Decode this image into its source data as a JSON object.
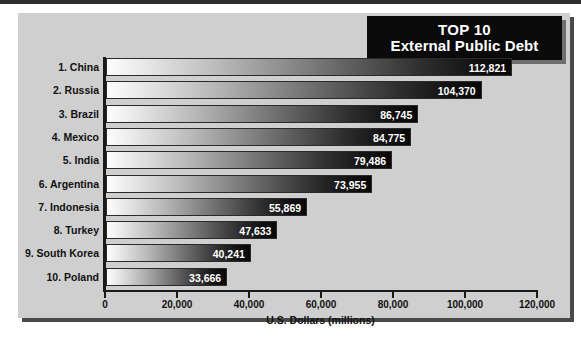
{
  "title": {
    "line1": "TOP 10",
    "line2": "External Public Debt"
  },
  "chart_data": {
    "type": "bar",
    "orientation": "horizontal",
    "title": "TOP 10 External Public Debt",
    "xlabel": "U.S. Dollars (millions)",
    "ylabel": "",
    "xlim": [
      0,
      120000
    ],
    "grid": false,
    "legend": false,
    "xticks": [
      0,
      20000,
      40000,
      60000,
      80000,
      100000,
      120000
    ],
    "xtick_labels": [
      "0",
      "20,000",
      "40,000",
      "60,000",
      "80,000",
      "100,000",
      "120,000"
    ],
    "categories": [
      "1. China",
      "2. Russia",
      "3. Brazil",
      "4. Mexico",
      "5. India",
      "6. Argentina",
      "7. Indonesia",
      "8. Turkey",
      "9. South Korea",
      "10. Poland"
    ],
    "values": [
      112821,
      104370,
      86745,
      84775,
      79486,
      73955,
      55869,
      47633,
      40241,
      33666
    ],
    "value_labels": [
      "112,821",
      "104,370",
      "86,745",
      "84,775",
      "79,486",
      "73,955",
      "55,869",
      "47,633",
      "40,241",
      "33,666"
    ]
  },
  "colors": {
    "panel": "#cfcfcf",
    "title_plate": "#0a0a0a",
    "title_text": "#ffffff",
    "axis": "#1a1a1a",
    "bar_start": "#fdfdfd",
    "bar_end": "#080808",
    "value_text": "#ffffff"
  }
}
